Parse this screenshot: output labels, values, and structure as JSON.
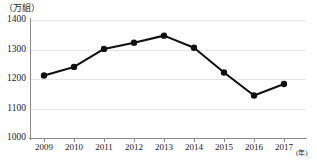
{
  "chart_data": {
    "type": "line",
    "title": "",
    "subtitle": "",
    "xlabel": "(年)",
    "ylabel": "（万組）",
    "unit_label": "（万組）",
    "x_unit_label": "(年)",
    "categories": [
      "2009",
      "2010",
      "2011",
      "2012",
      "2013",
      "2014",
      "2015",
      "2016",
      "2017"
    ],
    "values": [
      1212,
      1241,
      1302,
      1323,
      1347,
      1306,
      1222,
      1144,
      1183
    ],
    "series": [
      {
        "name": "",
        "values": [
          1212,
          1241,
          1302,
          1323,
          1347,
          1306,
          1222,
          1144,
          1183
        ]
      }
    ],
    "ylim": [
      1000,
      1400
    ],
    "xlim_categories": [
      "2009",
      "2017"
    ],
    "ytick_labels": [
      "1400",
      "1300",
      "1200",
      "1100",
      "1000"
    ],
    "ytick_values": [
      1400,
      1300,
      1200,
      1100,
      1000
    ],
    "ytick_step": 100,
    "grid": true,
    "grid_axis": "y",
    "legend": false,
    "legend_position": "none",
    "marker": "filled-circle",
    "line_color": "#111111",
    "marker_color": "#111111",
    "grid_color": "#e6e6e6",
    "axis_color": "#8a8a8a",
    "background_color": "#ffffff"
  }
}
